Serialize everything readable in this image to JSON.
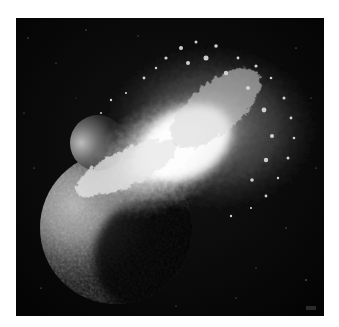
{
  "image": {
    "subject": "planetary collision artwork",
    "description": "Grayscale rendering of a large planet colliding with a smaller moon-like body, a bright white explosion spraying debris toward the upper right against a black starfield",
    "colors": {
      "page_background": "#ffffff",
      "space_background": "#060606",
      "explosion_core": "#ffffff",
      "planet_lit": "#9a9a9a",
      "planet_shadow": "#0a0a0a",
      "debris": "#c8c8c8"
    },
    "elements": {
      "large_planet": "large-planet",
      "small_moon": "small-moon",
      "explosion": "impact-explosion",
      "debris_cloud": "debris-cloud",
      "stars": "starfield"
    }
  }
}
